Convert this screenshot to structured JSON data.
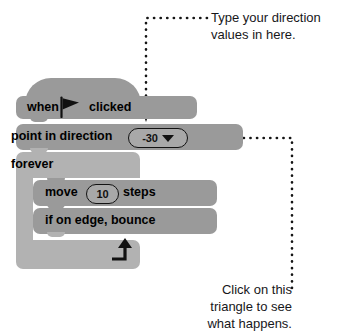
{
  "blocks": {
    "hat": {
      "when_label": "when",
      "clicked_label": "clicked",
      "flag_icon": "green-flag-icon"
    },
    "point_in_direction": {
      "label": "point in direction",
      "field_value": "-30",
      "dropdown_icon": "dropdown-triangle-icon"
    },
    "forever": {
      "label": "forever",
      "loop_icon": "loop-arrow-icon"
    },
    "move": {
      "prefix_label": "move",
      "field_value": "10",
      "suffix_label": "steps"
    },
    "if_on_edge_bounce": {
      "label": "if on edge, bounce"
    }
  },
  "annotations": {
    "top": "Type your direction values in here.",
    "bottom": "Click on this triangle to see what happens."
  },
  "colors": {
    "block_fill": "#9a9a9a",
    "loop_fill": "#b2b2b2",
    "field_fill": "#a8a8a8",
    "outline": "#121212",
    "text": "#0d0d0d",
    "annotation_text": "#17171a",
    "background": "#ffffff"
  }
}
